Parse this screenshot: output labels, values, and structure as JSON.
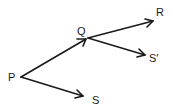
{
  "diagram": {
    "type": "vector-diagram",
    "points": {
      "P": {
        "label": "P",
        "x": 21,
        "y": 77
      },
      "Q": {
        "label": "Q",
        "x": 88,
        "y": 38
      },
      "R": {
        "label": "R",
        "x": 153,
        "y": 21
      },
      "S_prime": {
        "label": "S′",
        "x": 145,
        "y": 55
      },
      "S": {
        "label": "S",
        "x": 83,
        "y": 96
      }
    },
    "vectors": [
      {
        "from": "P",
        "to": "Q"
      },
      {
        "from": "Q",
        "to": "R"
      },
      {
        "from": "Q",
        "to": "S_prime"
      },
      {
        "from": "P",
        "to": "S"
      }
    ],
    "colors": {
      "ink": "#1a1a1a",
      "background": "#ffffff"
    }
  }
}
